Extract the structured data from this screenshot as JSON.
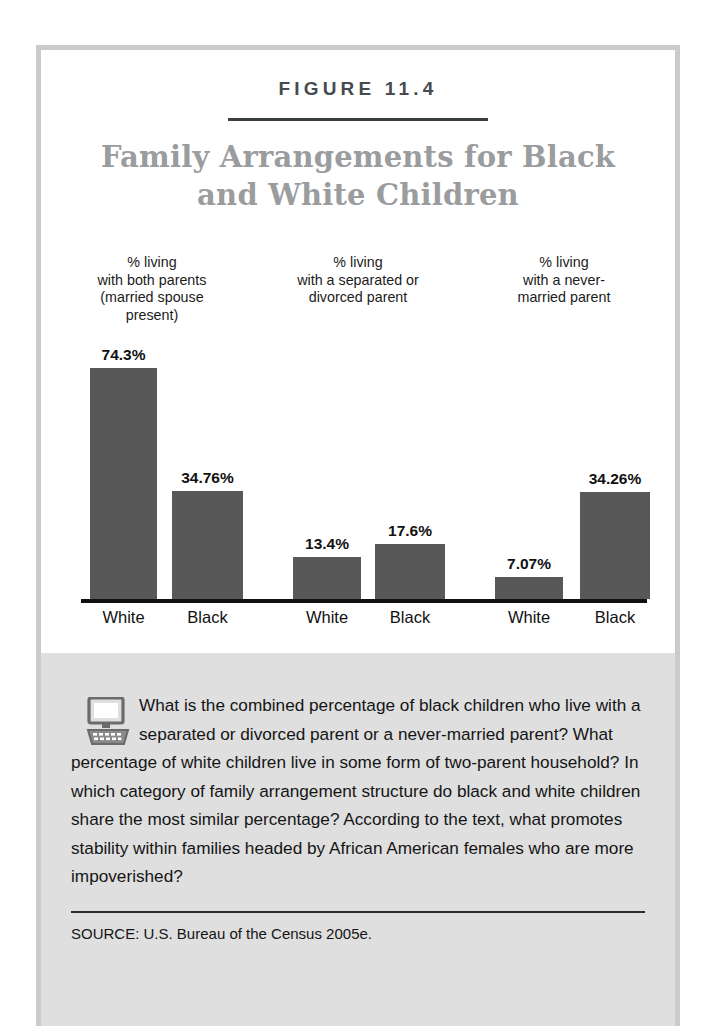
{
  "figure": {
    "number_label": "FIGURE 11.4",
    "title": "Family Arrangements for\nBlack and White Children",
    "source": "SOURCE:  U.S. Bureau of the Census 2005e.",
    "question": "What is the combined percentage of black children who live with a separated or divorced parent or a never-married parent? What percentage of white children live in some form of two-parent household? In which category of family arrangement structure do black and white children share the most similar percentage? According to the text, what promotes stability within families headed by African American females who are more impoverished?",
    "icon": "computer-icon"
  },
  "colors": {
    "bar": "#585858",
    "title": "#9a9c9e",
    "frame": "#c9cbcc",
    "panel": "#dfdfdf",
    "axis": "#111111"
  },
  "chart_data": {
    "type": "bar",
    "title": "Family Arrangements for Black and White Children",
    "xlabel": "",
    "ylabel": "",
    "ylim": [
      0,
      80
    ],
    "grid": false,
    "legend": "none",
    "group_labels": [
      "% living\nwith both parents\n(married spouse\npresent)",
      "% living\nwith a separated or\ndivorced parent",
      "% living\nwith a never-\nmarried parent"
    ],
    "categories": [
      "White",
      "Black",
      "White",
      "Black",
      "White",
      "Black"
    ],
    "values": [
      74.3,
      34.76,
      13.4,
      17.6,
      7.07,
      34.26
    ],
    "value_labels": [
      "74.3%",
      "34.76%",
      "13.4%",
      "17.6%",
      "7.07%",
      "34.26%"
    ],
    "groups": [
      {
        "label": "% living with both parents (married spouse present)",
        "bars": [
          {
            "category": "White",
            "value": 74.3,
            "label": "74.3%"
          },
          {
            "category": "Black",
            "value": 34.76,
            "label": "34.76%"
          }
        ]
      },
      {
        "label": "% living with a separated or divorced parent",
        "bars": [
          {
            "category": "White",
            "value": 13.4,
            "label": "13.4%"
          },
          {
            "category": "Black",
            "value": 17.6,
            "label": "17.6%"
          }
        ]
      },
      {
        "label": "% living with a never-married parent",
        "bars": [
          {
            "category": "White",
            "value": 7.07,
            "label": "7.07%"
          },
          {
            "category": "Black",
            "value": 34.26,
            "label": "34.26%"
          }
        ]
      }
    ]
  }
}
